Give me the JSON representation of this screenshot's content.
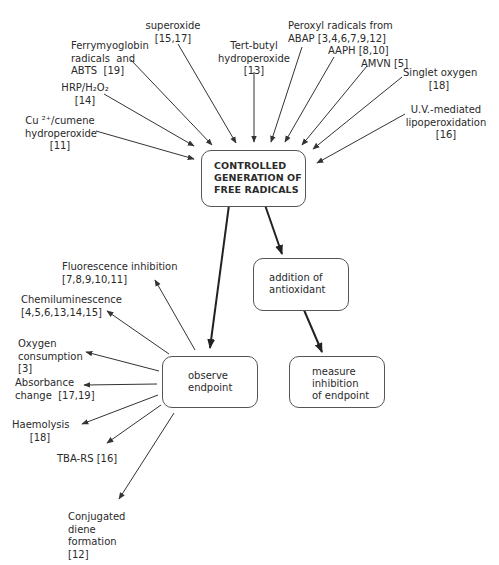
{
  "diagram": {
    "central_box": {
      "label": "CONTROLLED\nGENERATION OF\nFREE RADICALS"
    },
    "antioxidant_box": {
      "label": "addition of\nantioxidant"
    },
    "observe_box": {
      "label": "observe\nendpoint"
    },
    "measure_box": {
      "label": "measure\ninhibition\nof endpoint"
    },
    "radical_sources": [
      {
        "label": "Cu ²⁺/cumene\nhydroperoxide\n[11]"
      },
      {
        "label": "HRP/H₂O₂\n[14]"
      },
      {
        "label": "Ferrymyoglobin\nradicals  and\nABTS  [19]"
      },
      {
        "label": "superoxide\n[15,17]"
      },
      {
        "label": "Tert-butyl\nhydroperoxide\n[13]"
      },
      {
        "label": "Peroxyl radicals from\nABAP [3,4,6,7,9,12]"
      },
      {
        "label": "AAPH [8,10]"
      },
      {
        "label": "AMVN [5]"
      },
      {
        "label": "Singlet oxygen\n[18]"
      },
      {
        "label": "U.V.-mediated\nlipoperoxidation\n[16]"
      }
    ],
    "endpoints": [
      {
        "label": "Fluorescence inhibition\n[7,8,9,10,11]"
      },
      {
        "label": "Chemiluminescence\n[4,5,6,13,14,15]"
      },
      {
        "label": "Oxygen\nconsumption\n[3]"
      },
      {
        "label": "Absorbance\nchange  [17,19]"
      },
      {
        "label": "Haemolysis\n[18]"
      },
      {
        "label": "TBA-RS [16]"
      },
      {
        "label": "Conjugated\ndiene\nformation\n[12]"
      }
    ],
    "colors": {
      "line": "#333333",
      "text": "#2a2a2a",
      "box_border": "#555555"
    }
  }
}
